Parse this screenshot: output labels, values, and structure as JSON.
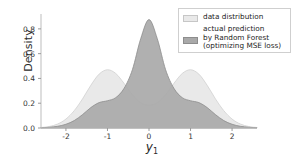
{
  "chart_data": {
    "type": "area",
    "title": "",
    "xlabel": "y₁",
    "ylabel": "Density",
    "xlim": [
      -2.6,
      2.6
    ],
    "ylim": [
      0.0,
      0.92
    ],
    "grid": false,
    "legend_position": "upper right",
    "xticks": [
      "-2",
      "-1",
      "0",
      "1",
      "2"
    ],
    "xtick_values": [
      -2,
      -1,
      0,
      1,
      2
    ],
    "yticks": [
      "0.0",
      "0.2",
      "0.4",
      "0.6",
      "0.8"
    ],
    "ytick_values": [
      0.0,
      0.2,
      0.4,
      0.6,
      0.8
    ],
    "series": [
      {
        "name": "data distribution",
        "color": "#e9e9e9",
        "edge_color": "#d0d0d0",
        "description": "bimodal density with modes near -1 and +1",
        "x": [
          -2.6,
          -2.4,
          -2.2,
          -2.0,
          -1.8,
          -1.6,
          -1.4,
          -1.2,
          -1.0,
          -0.8,
          -0.6,
          -0.4,
          -0.2,
          0.0,
          0.2,
          0.4,
          0.6,
          0.8,
          1.0,
          1.2,
          1.4,
          1.6,
          1.8,
          2.0,
          2.2,
          2.4,
          2.6
        ],
        "values": [
          0.004,
          0.012,
          0.032,
          0.072,
          0.14,
          0.235,
          0.345,
          0.435,
          0.47,
          0.44,
          0.36,
          0.27,
          0.205,
          0.185,
          0.205,
          0.27,
          0.36,
          0.44,
          0.47,
          0.435,
          0.345,
          0.235,
          0.14,
          0.072,
          0.032,
          0.012,
          0.004
        ]
      },
      {
        "name": "actual prediction by Random Forest (optimizing MSE loss)",
        "color": "#a9a9a9",
        "edge_color": "#8d8d8d",
        "description": "unimodal density peaked at 0 with shoulders near -1 and +1",
        "x": [
          -2.6,
          -2.4,
          -2.2,
          -2.0,
          -1.8,
          -1.6,
          -1.4,
          -1.2,
          -1.0,
          -0.8,
          -0.6,
          -0.4,
          -0.2,
          0.0,
          0.2,
          0.4,
          0.6,
          0.8,
          1.0,
          1.2,
          1.4,
          1.6,
          1.8,
          2.0,
          2.2,
          2.4,
          2.6
        ],
        "values": [
          0.002,
          0.006,
          0.014,
          0.03,
          0.06,
          0.108,
          0.165,
          0.205,
          0.22,
          0.245,
          0.32,
          0.47,
          0.72,
          0.875,
          0.72,
          0.47,
          0.32,
          0.245,
          0.22,
          0.205,
          0.165,
          0.108,
          0.06,
          0.03,
          0.014,
          0.006,
          0.002
        ]
      }
    ]
  },
  "legend": {
    "entries": [
      {
        "label": "data distribution",
        "swatch_color": "#e9e9e9"
      },
      {
        "label": "actual prediction\nby Random Forest\n(optimizing MSE loss)",
        "swatch_color": "#a9a9a9"
      }
    ]
  },
  "axes": {
    "ylabel": "Density",
    "xlabel_main": "y",
    "xlabel_sub": "1",
    "xticks": [
      "-2",
      "-1",
      "0",
      "1",
      "2"
    ],
    "yticks": [
      "0.8",
      "0.6",
      "0.4",
      "0.2",
      "0.0"
    ]
  }
}
